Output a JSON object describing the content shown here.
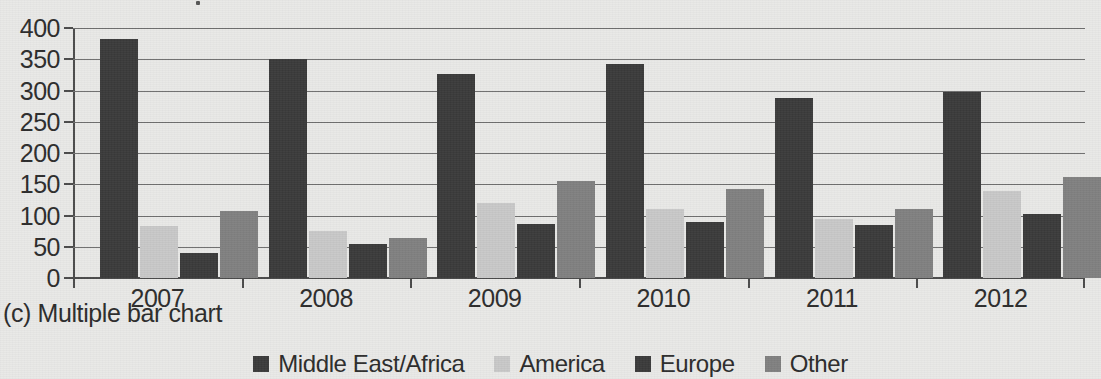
{
  "caption": "(c) Multiple bar chart",
  "top_marker": "title-remnant-dot",
  "colors": {
    "background": "#e9e9e7",
    "axis": "#4a4a4a",
    "gridline": "#6e6e6e",
    "text": "#2b2b2b",
    "middle_east_africa": "#3a3a3a",
    "america": "#c8c8c8",
    "europe": "#3a3a3a",
    "other": "#808080"
  },
  "legend": {
    "position": "bottom-center",
    "items": [
      {
        "label": "Middle East/Africa",
        "color": "#3a3a3a"
      },
      {
        "label": "America",
        "color": "#c8c8c8"
      },
      {
        "label": "Europe",
        "color": "#3a3a3a"
      },
      {
        "label": "Other",
        "color": "#808080"
      }
    ]
  },
  "chart_data": {
    "type": "bar",
    "title": "",
    "subtitle": "",
    "xlabel": "",
    "ylabel": "",
    "categories": [
      "2007",
      "2008",
      "2009",
      "2010",
      "2011",
      "2012"
    ],
    "ytick_labels": [
      "0",
      "50",
      "100",
      "150",
      "200",
      "250",
      "300",
      "350",
      "400"
    ],
    "ytick_values": [
      0,
      50,
      100,
      150,
      200,
      250,
      300,
      350,
      400
    ],
    "ylim": [
      0,
      400
    ],
    "grid": true,
    "grid_axis": "y",
    "legend_position": "bottom-center",
    "series": [
      {
        "name": "Middle East/Africa",
        "color": "#3a3a3a",
        "values": [
          383,
          350,
          327,
          343,
          288,
          298
        ]
      },
      {
        "name": "America",
        "color": "#c8c8c8",
        "values": [
          83,
          75,
          120,
          110,
          94,
          139
        ]
      },
      {
        "name": "Europe",
        "color": "#3a3a3a",
        "values": [
          40,
          55,
          87,
          89,
          85,
          103
        ]
      },
      {
        "name": "Other",
        "color": "#808080",
        "values": [
          108,
          64,
          155,
          143,
          110,
          162
        ]
      }
    ]
  }
}
